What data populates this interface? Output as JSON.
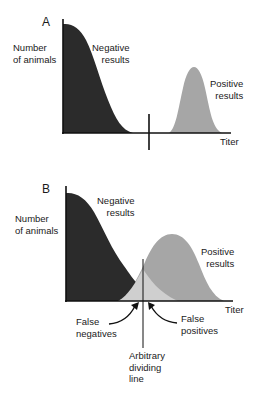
{
  "panels": [
    {
      "id": "A",
      "letter": "A",
      "y_label_line1": "Number",
      "y_label_line2": "of animals",
      "negative_line1": "Negative",
      "negative_line2": "results",
      "positive_line1": "Positive",
      "positive_line2": "results",
      "x_label": "Titer"
    },
    {
      "id": "B",
      "letter": "B",
      "y_label_line1": "Number",
      "y_label_line2": "of animals",
      "negative_line1": "Negative",
      "negative_line2": "results",
      "positive_line1": "Positive",
      "positive_line2": "results",
      "x_label": "Titer",
      "false_negatives_line1": "False",
      "false_negatives_line2": "negatives",
      "false_positives_line1": "False",
      "false_positives_line2": "positives",
      "divider_line1": "Arbitrary",
      "divider_line2": "dividing",
      "divider_line3": "line"
    }
  ],
  "colors": {
    "negative_fill": "#2b2b2b",
    "positive_fill": "#a6a6a6",
    "overlap_fill": "#cfcfcf",
    "axis": "#111111"
  }
}
